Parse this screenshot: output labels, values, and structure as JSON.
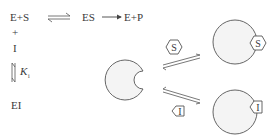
{
  "reaction": {
    "reactants": "E+S",
    "complex": "ES",
    "products": "E+P",
    "plus": "+",
    "inhibitor": "I",
    "inhibited_complex": "EI",
    "ki_symbol": "K",
    "ki_subscript": "i"
  },
  "diagram": {
    "substrate_label": "S",
    "inhibitor_label": "I"
  },
  "colors": {
    "stroke": "#555555",
    "fill": "#f4f4f4",
    "text": "#3a3a3a"
  }
}
